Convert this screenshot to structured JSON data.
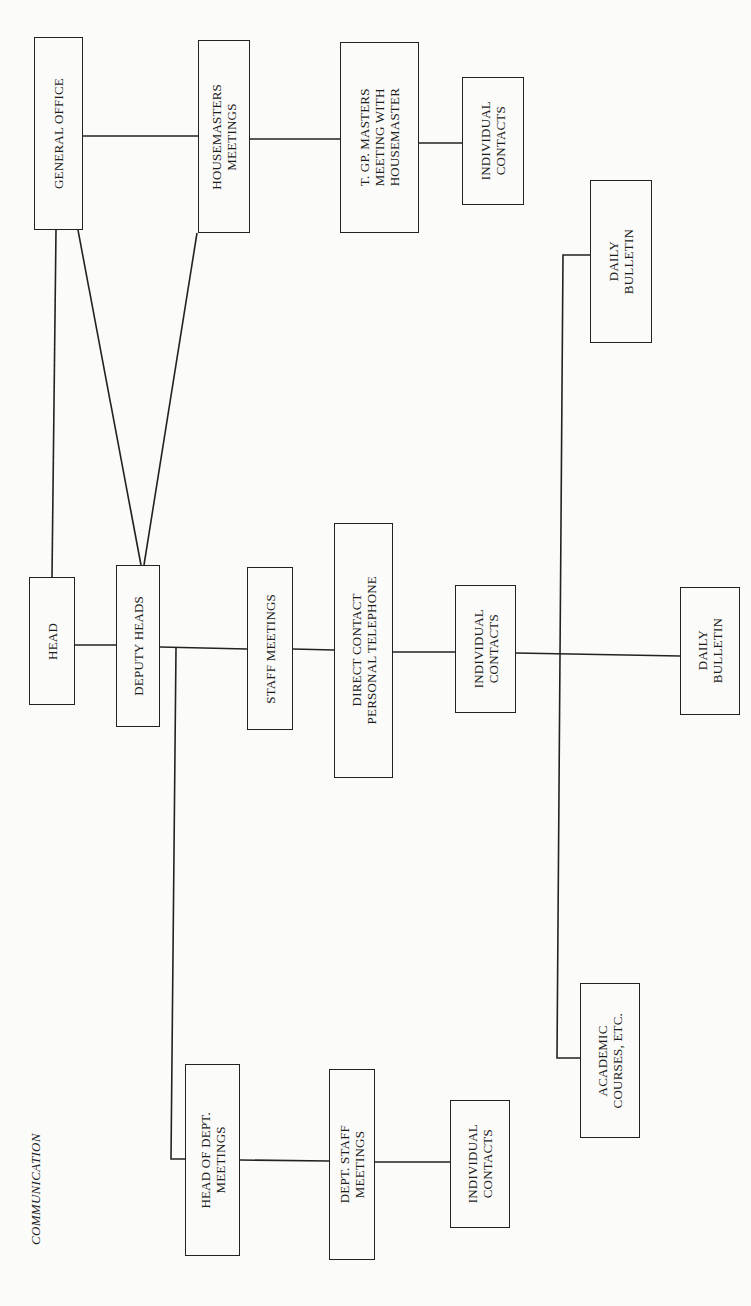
{
  "caption": "COMMUNICATION",
  "nodes": {
    "general_office": "GENERAL OFFICE",
    "housemasters_meetings": "HOUSEMASTERS\nMEETINGS",
    "tgp_masters": "T. GP. MASTERS\nMEETING WITH\nHOUSEMASTER",
    "individual_contacts_top": "INDIVIDUAL\nCONTACTS",
    "daily_bulletin_top": "DAILY\nBULLETIN",
    "head": "HEAD",
    "deputy_heads": "DEPUTY HEADS",
    "staff_meetings": "STAFF MEETINGS",
    "direct_contact": "DIRECT CONTACT\nPERSONAL TELEPHONE",
    "individual_contacts_mid": "INDIVIDUAL\nCONTACTS",
    "daily_bulletin_mid": "DAILY\nBULLETIN",
    "head_of_dept_meetings": "HEAD OF DEPT.\nMEETINGS",
    "dept_staff_meetings": "DEPT. STAFF\nMEETINGS",
    "individual_contacts_bottom": "INDIVIDUAL\nCONTACTS",
    "academic_courses": "ACADEMIC\nCOURSES, ETC."
  },
  "edges": [
    [
      "general_office",
      "housemasters_meetings"
    ],
    [
      "housemasters_meetings",
      "tgp_masters"
    ],
    [
      "tgp_masters",
      "individual_contacts_top"
    ],
    [
      "general_office",
      "head"
    ],
    [
      "general_office",
      "deputy_heads"
    ],
    [
      "housemasters_meetings",
      "deputy_heads"
    ],
    [
      "head",
      "deputy_heads"
    ],
    [
      "deputy_heads",
      "staff_meetings"
    ],
    [
      "staff_meetings",
      "direct_contact"
    ],
    [
      "direct_contact",
      "individual_contacts_mid"
    ],
    [
      "individual_contacts_mid",
      "daily_bulletin_mid"
    ],
    [
      "individual_contacts_mid",
      "daily_bulletin_top"
    ],
    [
      "individual_contacts_mid",
      "academic_courses"
    ],
    [
      "deputy_heads",
      "head_of_dept_meetings"
    ],
    [
      "head_of_dept_meetings",
      "dept_staff_meetings"
    ],
    [
      "dept_staff_meetings",
      "individual_contacts_bottom"
    ]
  ]
}
